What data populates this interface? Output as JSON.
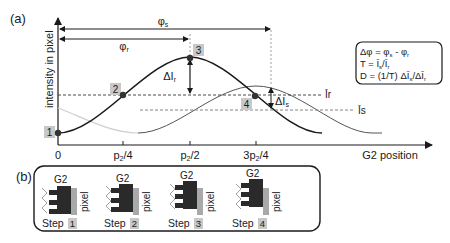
{
  "panel_a": {
    "label": "(a)",
    "y_axis_label": "intensity in pixel",
    "x_axis_label": "G2 position",
    "x_ticks": [
      {
        "label": "0",
        "x": 58
      },
      {
        "label": "p₂/4",
        "x": 123
      },
      {
        "label": "p₂/2",
        "x": 190
      },
      {
        "label": "3p₂/4",
        "x": 256
      }
    ],
    "phase_labels": {
      "phi_s": "φs",
      "phi_r": "φr"
    },
    "delta_labels": {
      "delta_ir": "ΔIr",
      "delta_is": "ΔIs"
    },
    "level_labels": {
      "ir": "Īris",
      "is": "Īs"
    },
    "level_r": "Īr",
    "level_s": "Īs",
    "points": [
      {
        "id": "1",
        "label": "1"
      },
      {
        "id": "2",
        "label": "2"
      },
      {
        "id": "3",
        "label": "3"
      },
      {
        "id": "4",
        "label": "4"
      }
    ],
    "formula_box": {
      "line1": "Δφ = φs - φr",
      "line2": "T = Īs/Īr",
      "line3": "D = (1/T) ΔĪs/ΔĪr"
    },
    "colors": {
      "reference_curve": "#1a1a1a",
      "sample_curve": "#555555",
      "faded_curve": "#cccccc",
      "label_box": "#c8c8c8"
    }
  },
  "panel_b": {
    "label": "(b)",
    "steps": [
      {
        "grating": "G2",
        "pixel": "pixel",
        "step_word": "Step",
        "step_num": "1"
      },
      {
        "grating": "G2",
        "pixel": "pixel",
        "step_word": "Step",
        "step_num": "2"
      },
      {
        "grating": "G2",
        "pixel": "pixel",
        "step_word": "Step",
        "step_num": "3"
      },
      {
        "grating": "G2",
        "pixel": "pixel",
        "step_word": "Step",
        "step_num": "4"
      }
    ]
  }
}
